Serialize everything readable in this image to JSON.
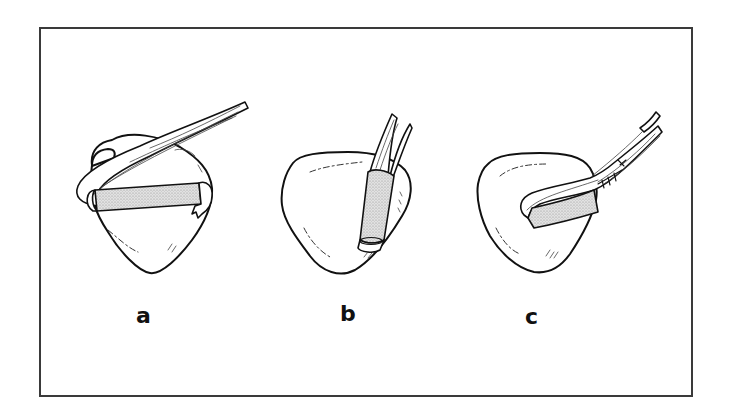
{
  "figure": {
    "type": "line-illustration",
    "frame": {
      "border_color": "#3a3a3a",
      "background": "#ffffff"
    },
    "colors": {
      "outline": "#111111",
      "graft_fill": "#d4d4d4",
      "label": "#111111"
    },
    "panels": [
      {
        "id": "a",
        "label": "a",
        "description": "Bone/patella with a tendon strip passed transversely through a tunnel; stippled graft visible across the face, tendon wrapped over the top and frayed end at right"
      },
      {
        "id": "b",
        "label": "b",
        "description": "Bone with a tendon inserted obliquely through a vertical tunnel; stippled sleeve around the tendon with the tendon end protruding at bottom"
      },
      {
        "id": "c",
        "label": "c",
        "description": "Bone with a tendon looped through a tunnel and sutured back onto itself; stippled section in tunnel and suture marks on the tendon"
      }
    ]
  }
}
